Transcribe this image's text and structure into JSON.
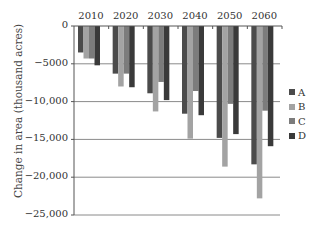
{
  "chart_data": {
    "type": "bar",
    "title": "",
    "xlabel": "",
    "ylabel": "Change in area (thousand acres)",
    "categories": [
      "2010",
      "2020",
      "2030",
      "2040",
      "2050",
      "2060"
    ],
    "series": [
      {
        "name": "A",
        "color": "#4b4b4b",
        "values": [
          -3500,
          -6300,
          -8900,
          -11600,
          -14800,
          -18300
        ]
      },
      {
        "name": "B",
        "color": "#a3a3a3",
        "values": [
          -4300,
          -8000,
          -11300,
          -14900,
          -18600,
          -22800
        ]
      },
      {
        "name": "C",
        "color": "#7c7c7c",
        "values": [
          -4300,
          -6300,
          -7400,
          -8600,
          -10300,
          -11200
        ]
      },
      {
        "name": "D",
        "color": "#3a3a3a",
        "values": [
          -5200,
          -8100,
          -9800,
          -11800,
          -14300,
          -15900
        ]
      }
    ],
    "ylim": [
      -25000,
      0
    ],
    "yticks": [
      0,
      -5000,
      -10000,
      -15000,
      -20000,
      -25000
    ],
    "ytick_labels": [
      "0",
      "-5000",
      "-10,000",
      "-15,000",
      "-20,000",
      "-25,000"
    ],
    "grid": true,
    "legend_position": "right"
  }
}
